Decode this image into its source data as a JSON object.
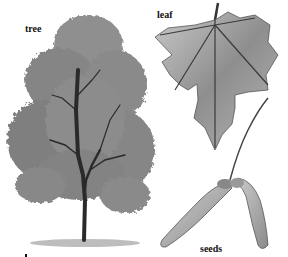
{
  "labels": {
    "tree": "tree",
    "leaf": "leaf",
    "seeds": "seeds"
  },
  "colors": {
    "background": "#ffffff",
    "foliage": "#8a8a8a",
    "trunk": "#2a2a2a",
    "leaf_fill": "#9a9a9a",
    "seed_fill": "#a8a8a8"
  }
}
